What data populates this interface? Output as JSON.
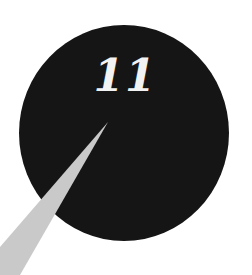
{
  "badge": {
    "number": "11",
    "circle_color": "#151515",
    "text_color": "#f2f2f2"
  },
  "pointer": {
    "color": "#c9c9c9"
  }
}
